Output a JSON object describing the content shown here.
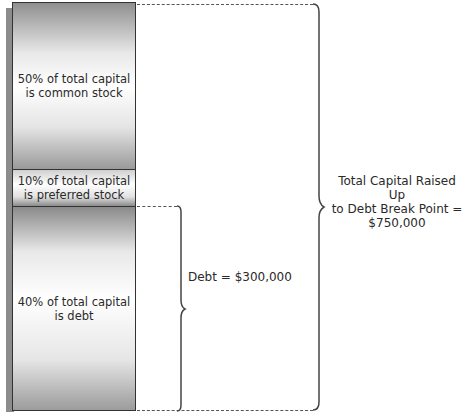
{
  "diagram": {
    "segments": [
      {
        "id": "common",
        "line1": "50% of total capital",
        "line2": "is common stock",
        "percent": 50
      },
      {
        "id": "preferred",
        "line1": "10% of total capital",
        "line2": "is preferred stock",
        "percent": 10
      },
      {
        "id": "debt",
        "line1": "40% of total capital",
        "line2": "is debt",
        "percent": 40
      }
    ],
    "debt_brace_label": "Debt = $300,000",
    "total_brace_label": {
      "line1": "Total Capital Raised Up",
      "line2": "to Debt Break Point =",
      "line3": "$750,000"
    }
  }
}
